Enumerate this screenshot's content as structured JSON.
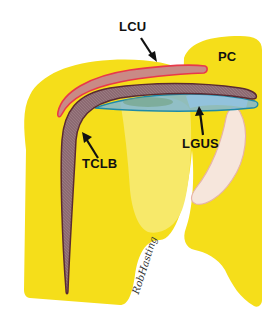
{
  "figure": {
    "labels": {
      "lcu": "LCU",
      "pc": "PC",
      "lgus": "LGUS",
      "tclb": "TCLB"
    },
    "signature": "RobHasting"
  },
  "colors": {
    "bone_yellow": "#f5de1a",
    "bone_light_yellow": "#f7e96a",
    "tendon_fill": "#8c6a72",
    "tendon_outline": "#5a2a32",
    "ligament_red_fill": "#c98a86",
    "ligament_red_outline": "#e8394a",
    "ligament_blue_fill": "#7fb7d6",
    "ligament_blue_outline": "#1f8aa8",
    "cartilage_fill": "#f6e6dc",
    "cartilage_outline": "#e7b3a8",
    "arrow": "#111111"
  }
}
